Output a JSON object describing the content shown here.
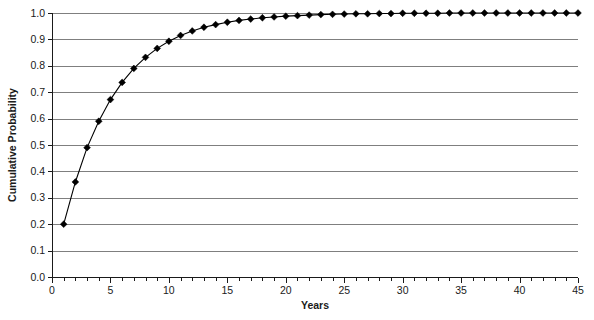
{
  "figure": {
    "background_color": "#ffffff",
    "plot": {
      "left": 52,
      "right": 578,
      "top": 13,
      "bottom": 277,
      "border_color": "#1a1a1a",
      "grid_color": "#7f7f7f"
    }
  },
  "chart_data": {
    "type": "line",
    "title": "",
    "xlabel": "Years",
    "ylabel": "Cumulative Probability",
    "xlim": [
      0,
      45
    ],
    "ylim": [
      0.0,
      1.0
    ],
    "grid": "horizontal",
    "legend": "none",
    "marker": "diamond",
    "marker_color": "#000000",
    "line_color": "#000000",
    "xticks": [
      0,
      5,
      10,
      15,
      20,
      25,
      30,
      35,
      40,
      45
    ],
    "xtick_labels": [
      "0",
      "5",
      "10",
      "15",
      "20",
      "25",
      "30",
      "35",
      "40",
      "45"
    ],
    "xtick_minor_step": 1,
    "yticks": [
      0.0,
      0.1,
      0.2,
      0.3,
      0.4,
      0.5,
      0.6,
      0.7,
      0.8,
      0.9,
      1.0
    ],
    "ytick_labels": [
      "0.0",
      "0.1",
      "0.2",
      "0.3",
      "0.4",
      "0.5",
      "0.6",
      "0.7",
      "0.8",
      "0.9",
      "1.0"
    ],
    "x": [
      1,
      2,
      3,
      4,
      5,
      6,
      7,
      8,
      9,
      10,
      11,
      12,
      13,
      14,
      15,
      16,
      17,
      18,
      19,
      20,
      21,
      22,
      23,
      24,
      25,
      26,
      27,
      28,
      29,
      30,
      31,
      32,
      33,
      34,
      35,
      36,
      37,
      38,
      39,
      40,
      41,
      42,
      43,
      44,
      45
    ],
    "values": [
      0.2,
      0.36,
      0.49,
      0.59,
      0.672,
      0.737,
      0.79,
      0.832,
      0.866,
      0.893,
      0.915,
      0.932,
      0.946,
      0.956,
      0.965,
      0.972,
      0.977,
      0.982,
      0.985,
      0.988,
      0.99,
      0.992,
      0.994,
      0.995,
      0.996,
      0.997,
      0.997,
      0.998,
      0.998,
      0.999,
      0.999,
      0.999,
      0.999,
      1.0,
      1.0,
      1.0,
      1.0,
      1.0,
      1.0,
      1.0,
      1.0,
      1.0,
      1.0,
      1.0,
      1.0
    ]
  },
  "labels": {
    "y_axis_title": "Cumulative Probability",
    "x_axis_title": "Years"
  },
  "caption": {
    "partial_text": ""
  }
}
